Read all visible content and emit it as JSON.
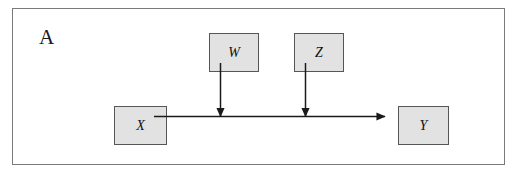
{
  "figure": {
    "panel_label": "A",
    "type": "causal-path-diagram",
    "background_color": "#ffffff",
    "frame_border_color": "#7a7a7a",
    "node_fill_color": "#e2e2e2",
    "node_border_color": "#565656",
    "edge_color": "#1a1a1a",
    "nodes": [
      {
        "id": "W",
        "label": "W",
        "x": 196,
        "y": 24,
        "width": 50,
        "height": 39
      },
      {
        "id": "Z",
        "label": "Z",
        "x": 281,
        "y": 24,
        "width": 50,
        "height": 39
      },
      {
        "id": "X",
        "label": "X",
        "x": 101,
        "y": 97,
        "width": 53,
        "height": 39
      },
      {
        "id": "Y",
        "label": "Y",
        "x": 385,
        "y": 97,
        "width": 51,
        "height": 39
      }
    ],
    "edges": [
      {
        "id": "x-to-y",
        "from": "X",
        "to": "Y",
        "orientation": "horizontal",
        "arrowhead": "at-target"
      },
      {
        "id": "w-to-path",
        "from": "W",
        "to": "x-to-y",
        "orientation": "vertical",
        "arrowhead": "at-target"
      },
      {
        "id": "z-to-path",
        "from": "Z",
        "to": "x-to-y",
        "orientation": "vertical",
        "arrowhead": "at-target"
      }
    ]
  }
}
